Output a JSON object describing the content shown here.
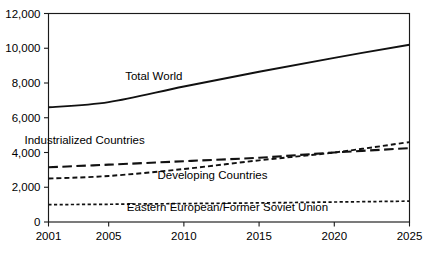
{
  "chart_data": {
    "type": "line",
    "title": "",
    "subtitle": "",
    "xlabel": "",
    "ylabel": "",
    "xlim": [
      2001,
      2025
    ],
    "ylim": [
      0,
      12000
    ],
    "grid": false,
    "legend_position": "inline-annotations",
    "x_tick_labels": [
      "2001",
      "2005",
      "2010",
      "2015",
      "2020",
      "2025"
    ],
    "x_ticks": [
      2001,
      2005,
      2010,
      2015,
      2020,
      2025
    ],
    "y_tick_labels": [
      "0",
      "2,000",
      "4,000",
      "6,000",
      "8,000",
      "10,000",
      "12,000"
    ],
    "y_ticks": [
      0,
      2000,
      4000,
      6000,
      8000,
      10000,
      12000
    ],
    "x": [
      2001,
      2005,
      2010,
      2015,
      2020,
      2025
    ],
    "series": [
      {
        "name": "Total World",
        "label": "Total World",
        "style": "solid",
        "values": [
          6600,
          6900,
          7800,
          8650,
          9450,
          10200
        ]
      },
      {
        "name": "Industrialized Countries",
        "label": "Industrialized Countries",
        "style": "long-dash",
        "values": [
          3150,
          3300,
          3500,
          3700,
          4000,
          4250
        ]
      },
      {
        "name": "Developing Countries",
        "label": "Developing Countries",
        "style": "short-dash",
        "values": [
          2500,
          2650,
          3050,
          3550,
          4000,
          4600
        ]
      },
      {
        "name": "Eastern European/Former Soviet Union",
        "label": "Eastern European/Former Soviet Union",
        "style": "dotted-dash",
        "values": [
          1000,
          1020,
          1060,
          1100,
          1150,
          1200
        ]
      }
    ],
    "annotations": [
      {
        "text": "Total World",
        "x": 2008.0,
        "y": 8200
      },
      {
        "text": "Industrialized Countries",
        "x": 2003.4,
        "y": 4480
      },
      {
        "text": "Developing Countries",
        "x": 2011.9,
        "y": 2480
      },
      {
        "text": "Eastern European/Former Soviet Union",
        "x": 2012.9,
        "y": 620
      }
    ],
    "colors": {
      "line": "#111111",
      "axis": "#1a1a1a",
      "background": "#ffffff",
      "text": "#000000"
    }
  }
}
